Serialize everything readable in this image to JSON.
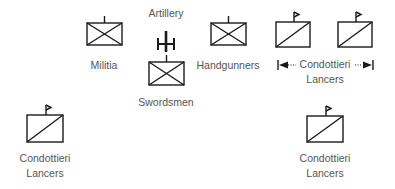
{
  "diagram": {
    "colors": {
      "stroke": "#1a1a1a",
      "text": "#555555",
      "background": "#ffffff"
    },
    "units": [
      {
        "id": "artillery",
        "label": "Artillery",
        "symbol": "artillery-icon"
      },
      {
        "id": "militia",
        "label": "Militia",
        "symbol": "infantry-box-icon"
      },
      {
        "id": "swordsmen",
        "label": "Swordsmen",
        "symbol": "infantry-box-icon"
      },
      {
        "id": "handgunners",
        "label": "Handgunners",
        "symbol": "infantry-box-icon"
      },
      {
        "id": "lancers-top",
        "label_line1": "Condottieri",
        "label_line2": "Lancers",
        "symbol": "cavalry-box-flag-icon",
        "count": 2,
        "span_indicator": "double-arrow"
      },
      {
        "id": "lancers-bottom-left",
        "label_line1": "Condottieri",
        "label_line2": "Lancers",
        "symbol": "cavalry-box-flag-icon"
      },
      {
        "id": "lancers-bottom-right",
        "label_line1": "Condottieri",
        "label_line2": "Lancers",
        "symbol": "cavalry-box-flag-icon"
      }
    ]
  }
}
